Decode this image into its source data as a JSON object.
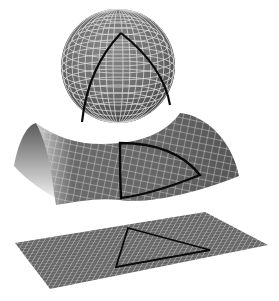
{
  "figure": {
    "colors": {
      "background": "#ffffff",
      "surface": "#6e6e6e",
      "surface_dark": "#4a4a4a",
      "grid": "#d8d8d8",
      "triangle": "#0a0a0a"
    },
    "shapes": [
      {
        "name": "sphere",
        "curvature": "positive"
      },
      {
        "name": "saddle",
        "curvature": "negative"
      },
      {
        "name": "plane",
        "curvature": "flat"
      }
    ]
  }
}
